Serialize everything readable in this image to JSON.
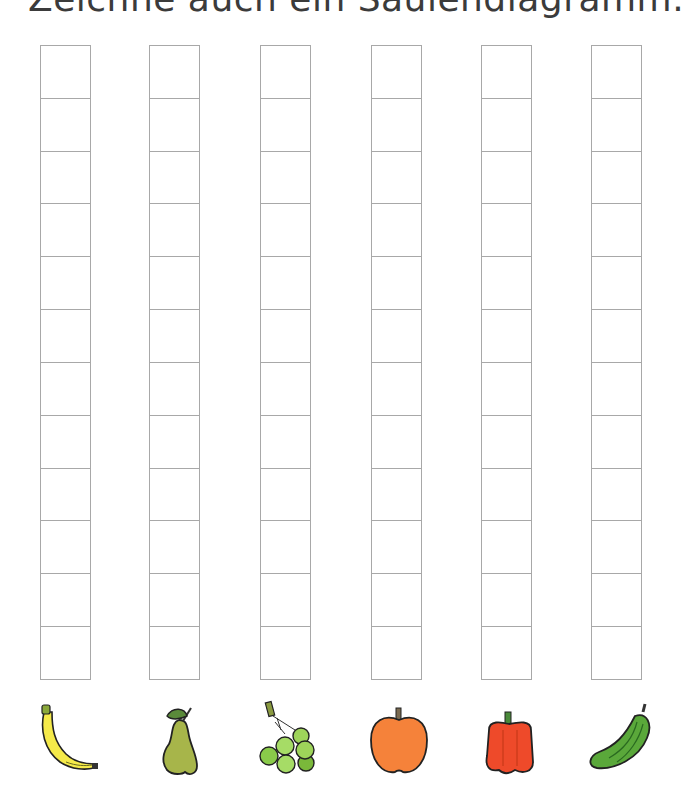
{
  "title": "Zeichne auch ein Säulendiagramm.",
  "grid": {
    "cells_per_column": 12,
    "line_color": "#a8a8a8"
  },
  "columns": [
    {
      "label": "banana",
      "icon": "banana-icon",
      "filled_cells": 0,
      "color": "#f5ea4a"
    },
    {
      "label": "pear",
      "icon": "pear-icon",
      "filled_cells": 0,
      "color": "#a7b54a"
    },
    {
      "label": "grapes",
      "icon": "grapes-icon",
      "filled_cells": 0,
      "color": "#9ed45a"
    },
    {
      "label": "apple",
      "icon": "apple-icon",
      "filled_cells": 0,
      "color": "#f5823a"
    },
    {
      "label": "bell pepper",
      "icon": "bell-pepper-icon",
      "filled_cells": 0,
      "color": "#ee4a2a"
    },
    {
      "label": "cucumber",
      "icon": "cucumber-icon",
      "filled_cells": 0,
      "color": "#5aa83a"
    }
  ]
}
